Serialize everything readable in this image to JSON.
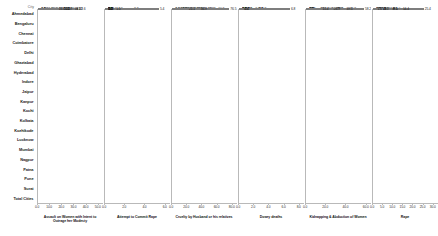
{
  "axis_header": "City",
  "cities": [
    "Ahmedabad",
    "Bengaluru",
    "Chennai",
    "Coimbatore",
    "Delhi",
    "Ghaziabad",
    "Hyderabad",
    "Indore",
    "Jaipur",
    "Kanpur",
    "Kochi",
    "Kolkata",
    "Kozhikode",
    "Lucknow",
    "Mumbai",
    "Nagpur",
    "Patna",
    "Pune",
    "Surat",
    "Total Cities"
  ],
  "chart_data": {
    "type": "bar",
    "orientation": "horizontal",
    "layout": "small-multiples",
    "title": "",
    "ylabel": "City",
    "grid": false,
    "legend": false,
    "categories": [
      "Ahmedabad",
      "Bengaluru",
      "Chennai",
      "Coimbatore",
      "Delhi",
      "Ghaziabad",
      "Hyderabad",
      "Indore",
      "Jaipur",
      "Kanpur",
      "Kochi",
      "Kolkata",
      "Kozhikode",
      "Lucknow",
      "Mumbai",
      "Nagpur",
      "Patna",
      "Pune",
      "Surat",
      "Total Cities"
    ],
    "panels": [
      {
        "title": "Assault on Women with Intent to Outrage her Modesty",
        "xlim": [
          0,
          50
        ],
        "ticks": [
          0,
          10,
          20,
          30,
          40,
          50
        ],
        "ticklabels": [
          "0.0",
          "10.0",
          "20.0",
          "30.0",
          "40.0",
          "50.0"
        ],
        "values": [
          7.6,
          24.1,
          1.6,
          0.1,
          33.6,
          17.0,
          10.9,
          29.4,
          16.4,
          20.3,
          22.5,
          4.5,
          10.1,
          31.2,
          20.1,
          22.7,
          1.0,
          21.0,
          3.6,
          16.4
        ],
        "labels": [
          "7.6",
          "24.1",
          "1.6",
          "0.1",
          "33.6",
          "17.0",
          "10.9",
          "29.4",
          "16.4",
          "20.3",
          "22.5",
          "4.5",
          "10.1",
          "31.2",
          "20.1",
          "22.7",
          "1.0",
          "21.0",
          "3.6",
          "16.4"
        ]
      },
      {
        "title": "Attempt to Commit Rape",
        "xlim": [
          0,
          6
        ],
        "ticks": [
          0,
          2,
          4,
          6
        ],
        "ticklabels": [
          "0.0",
          "2.0",
          "4.0",
          "6.0"
        ],
        "values": [
          0.1,
          0.0,
          0.0,
          0.0,
          0.1,
          1.2,
          0.1,
          0.0,
          0.6,
          0.2,
          0.0,
          0.2,
          2.8,
          5.4,
          1.0,
          0.0,
          0.0,
          0.3,
          0.0,
          0.2
        ],
        "labels": [
          "0.1",
          "0.0",
          "0.0",
          "0.0",
          "0.1",
          "1.2",
          "0.1",
          "0.0",
          "0.6",
          "0.2",
          "0.0",
          "0.2",
          "2.8",
          "5.4",
          "1.0",
          "0.0",
          "0.0",
          "0.3",
          "0.0",
          "0.2"
        ]
      },
      {
        "title": "Cruelty by Husband or his relatives",
        "xlim": [
          0,
          80
        ],
        "ticks": [
          0,
          20,
          40,
          60,
          80
        ],
        "ticklabels": [
          "0.0",
          "20.0",
          "40.0",
          "60.0",
          "80.0"
        ],
        "values": [
          22.2,
          13.1,
          2.9,
          2.9,
          30.5,
          46.7,
          26.0,
          31.4,
          60.2,
          40.2,
          48.4,
          10.0,
          12.6,
          33.8,
          76.5,
          9.0,
          17.2,
          36.9,
          10.9,
          21.1
        ],
        "labels": [
          "22.2",
          "13.1",
          "2.9",
          "2.9",
          "30.5",
          "46.7",
          "26.0",
          "31.4",
          "60.2",
          "40.2",
          "48.4",
          "10.0",
          "12.6",
          "33.8",
          "76.5",
          "9.0",
          "17.2",
          "36.9",
          "10.9",
          "21.1"
        ]
      },
      {
        "title": "Dowry deaths",
        "xlim": [
          0,
          8
        ],
        "ticks": [
          0,
          2,
          4,
          6,
          8
        ],
        "ticklabels": [
          "0.0",
          "2.0",
          "4.0",
          "6.0",
          "8.0"
        ],
        "values": [
          0.1,
          1.0,
          0.1,
          0.0,
          1.0,
          2.0,
          0.7,
          1.0,
          2.4,
          2.5,
          2.9,
          0.0,
          0.2,
          0.0,
          2.5,
          0.1,
          0.7,
          6.8,
          0.5,
          0.6
        ],
        "labels": [
          "0.1",
          "1.0",
          "0.1",
          "0.0",
          "1.0",
          "2.0",
          "0.7",
          "1.0",
          "2.4",
          "2.5",
          "2.9",
          "0.0",
          "0.2",
          "0.0",
          "2.5",
          "0.1",
          "0.7",
          "6.8",
          "0.5",
          "0.6"
        ]
      },
      {
        "title": "Kidnapping & Abduction of Women",
        "xlim": [
          0,
          60
        ],
        "ticks": [
          0,
          20,
          40,
          60
        ],
        "ticklabels": [
          "0.0",
          "20.0",
          "40.0",
          "60.0"
        ],
        "values": [
          3.9,
          13.6,
          0.4,
          0.2,
          42.8,
          29.1,
          3.0,
          0.0,
          30.5,
          24.0,
          58.2,
          0.6,
          2.6,
          0.6,
          30.1,
          13.0,
          39.5,
          20.1,
          26.9,
          15.4
        ],
        "labels": [
          "3.9",
          "13.6",
          "0.4",
          "0.2",
          "42.8",
          "29.1",
          "3.0",
          "0.0",
          "30.5",
          "24.0",
          "58.2",
          "0.6",
          "2.6",
          "0.6",
          "30.1",
          "13.0",
          "39.5",
          "20.1",
          "26.9",
          "15.4"
        ]
      },
      {
        "title": "Rape",
        "xlim": [
          0,
          30
        ],
        "ticks": [
          0,
          5,
          10,
          15,
          20,
          25,
          30
        ],
        "ticklabels": [
          "0.0",
          "5.0",
          "10.0",
          "15.0",
          "20.0",
          "25.0",
          "30.0"
        ],
        "values": [
          0.1,
          3.2,
          0.7,
          0.0,
          25.4,
          5.8,
          1.6,
          10.0,
          14.4,
          5.0,
          9.5,
          7.9,
          0.5,
          5.1,
          9.5,
          2.4,
          3.8,
          3.7,
          5.0,
          1.6,
          5.3
        ],
        "labels": [
          "0.1",
          "3.2",
          "0.7",
          "0.0",
          "25.4",
          "5.8",
          "1.6",
          "10.0",
          "14.4",
          "5.0",
          "9.5",
          "7.9",
          "0.5",
          "5.1",
          "9.5",
          "2.4",
          "3.8",
          "3.7",
          "5.0",
          "1.6",
          "5.3"
        ]
      }
    ]
  }
}
